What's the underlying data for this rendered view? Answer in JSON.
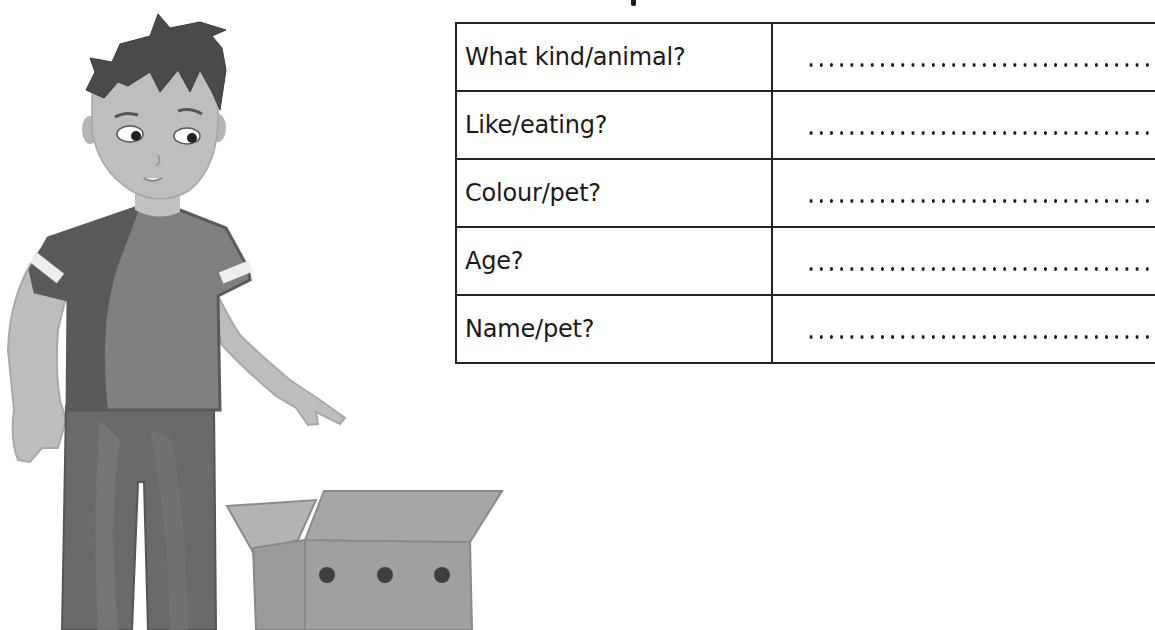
{
  "worksheet": {
    "heading_fragment": "",
    "table": {
      "rows": [
        {
          "question": "What kind/animal?",
          "answer": "",
          "answer_placeholder": "..............................."
        },
        {
          "question": "Like/eating?",
          "answer": "",
          "answer_placeholder": "..............................."
        },
        {
          "question": "Colour/pet?",
          "answer": "",
          "answer_placeholder": "..............................."
        },
        {
          "question": "Age?",
          "answer": "",
          "answer_placeholder": "..............................."
        },
        {
          "question": "Name/pet?",
          "answer": "",
          "answer_placeholder": "..............................."
        }
      ]
    },
    "illustration": {
      "subject": "boy-looking-into-box",
      "box_holes": 3
    }
  },
  "colors": {
    "hair": "#4a4a4a",
    "skin": "#b9b9b9",
    "shirt_dark": "#5a5a5a",
    "shirt_light": "#808080",
    "pants": "#6a6a6a",
    "box": "#9c9c9c",
    "box_hole": "#3f3f3f",
    "table_border": "#222222",
    "text": "#1a1a1a"
  }
}
